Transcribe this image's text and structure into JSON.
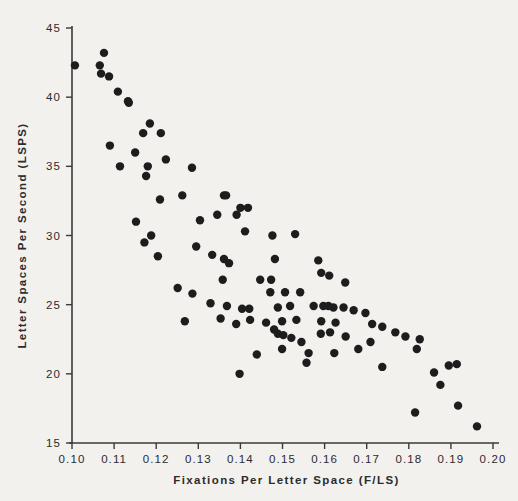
{
  "figure": {
    "background_color": "#f2f1ee",
    "point_color": "#1d1d1d",
    "axis_color": "#3a3a3a"
  },
  "chart_data": {
    "type": "scatter",
    "title": "",
    "xlabel": "Fixations  Per  Letter  Space  (F/LS)",
    "ylabel": "Letter  Spaces  Per  Second  (LSPS)",
    "xlim": [
      0.1,
      0.2
    ],
    "ylim": [
      15,
      45
    ],
    "xticks": [
      0.1,
      0.11,
      0.12,
      0.13,
      0.14,
      0.15,
      0.16,
      0.17,
      0.18,
      0.19,
      0.2
    ],
    "xticklabels": [
      "0.10",
      "0.11",
      "0.12",
      "0.13",
      "0.14",
      "0.15",
      "0.16",
      "0.17",
      "0.18",
      "0.19",
      "0.20"
    ],
    "yticks": [
      15,
      20,
      25,
      30,
      35,
      40,
      45
    ],
    "yticklabels": [
      "15",
      "20",
      "25",
      "30",
      "35",
      "40",
      "45"
    ],
    "grid": false,
    "legend": null,
    "marker": "filled-circle",
    "marker_size": 4.2,
    "points": [
      [
        0.1007,
        42.3
      ],
      [
        0.1076,
        43.2
      ],
      [
        0.1066,
        42.3
      ],
      [
        0.1069,
        41.7
      ],
      [
        0.1088,
        41.5
      ],
      [
        0.1109,
        40.4
      ],
      [
        0.1133,
        39.7
      ],
      [
        0.1135,
        39.6
      ],
      [
        0.1185,
        38.1
      ],
      [
        0.1169,
        37.4
      ],
      [
        0.1211,
        37.4
      ],
      [
        0.109,
        36.5
      ],
      [
        0.115,
        36.0
      ],
      [
        0.1114,
        35.0
      ],
      [
        0.1223,
        35.5
      ],
      [
        0.118,
        35.0
      ],
      [
        0.1176,
        34.3
      ],
      [
        0.1285,
        34.9
      ],
      [
        0.1209,
        32.6
      ],
      [
        0.1361,
        32.9
      ],
      [
        0.1366,
        32.9
      ],
      [
        0.1262,
        32.9
      ],
      [
        0.14,
        32.0
      ],
      [
        0.1418,
        32.0
      ],
      [
        0.1152,
        31.0
      ],
      [
        0.1304,
        31.1
      ],
      [
        0.1345,
        31.5
      ],
      [
        0.1391,
        31.5
      ],
      [
        0.1188,
        30.0
      ],
      [
        0.1172,
        29.5
      ],
      [
        0.1295,
        29.2
      ],
      [
        0.1204,
        28.5
      ],
      [
        0.1333,
        28.6
      ],
      [
        0.1361,
        28.3
      ],
      [
        0.1373,
        28.0
      ],
      [
        0.1411,
        30.3
      ],
      [
        0.1476,
        30.0
      ],
      [
        0.153,
        30.1
      ],
      [
        0.1482,
        28.3
      ],
      [
        0.1585,
        28.2
      ],
      [
        0.1592,
        27.3
      ],
      [
        0.1358,
        26.8
      ],
      [
        0.1447,
        26.8
      ],
      [
        0.1473,
        26.8
      ],
      [
        0.1611,
        27.1
      ],
      [
        0.1649,
        26.6
      ],
      [
        0.1471,
        25.9
      ],
      [
        0.1506,
        25.9
      ],
      [
        0.1542,
        25.9
      ],
      [
        0.1368,
        24.9
      ],
      [
        0.1404,
        24.7
      ],
      [
        0.1421,
        24.7
      ],
      [
        0.1489,
        24.8
      ],
      [
        0.1518,
        24.9
      ],
      [
        0.1574,
        24.9
      ],
      [
        0.1597,
        24.9
      ],
      [
        0.1609,
        24.9
      ],
      [
        0.1621,
        24.8
      ],
      [
        0.1645,
        24.8
      ],
      [
        0.1669,
        24.6
      ],
      [
        0.1697,
        24.4
      ],
      [
        0.1423,
        23.9
      ],
      [
        0.1461,
        23.7
      ],
      [
        0.1499,
        23.8
      ],
      [
        0.1533,
        23.9
      ],
      [
        0.1592,
        23.8
      ],
      [
        0.1626,
        23.7
      ],
      [
        0.1713,
        23.6
      ],
      [
        0.1737,
        23.4
      ],
      [
        0.148,
        23.2
      ],
      [
        0.1489,
        22.9
      ],
      [
        0.1502,
        22.8
      ],
      [
        0.1521,
        22.6
      ],
      [
        0.1545,
        22.3
      ],
      [
        0.1768,
        23.0
      ],
      [
        0.1792,
        22.7
      ],
      [
        0.1499,
        21.8
      ],
      [
        0.1591,
        22.9
      ],
      [
        0.1613,
        23.0
      ],
      [
        0.165,
        22.7
      ],
      [
        0.1709,
        22.3
      ],
      [
        0.1826,
        22.5
      ],
      [
        0.1819,
        21.8
      ],
      [
        0.1398,
        20.0
      ],
      [
        0.1557,
        20.8
      ],
      [
        0.1737,
        20.5
      ],
      [
        0.186,
        20.1
      ],
      [
        0.1895,
        20.6
      ],
      [
        0.1914,
        20.7
      ],
      [
        0.1875,
        19.2
      ],
      [
        0.1815,
        17.2
      ],
      [
        0.1917,
        17.7
      ],
      [
        0.1962,
        16.2
      ],
      [
        0.1439,
        21.4
      ],
      [
        0.1286,
        25.8
      ],
      [
        0.1251,
        26.2
      ],
      [
        0.1329,
        25.1
      ],
      [
        0.1268,
        23.8
      ],
      [
        0.1353,
        24.0
      ],
      [
        0.139,
        23.6
      ],
      [
        0.1562,
        21.5
      ],
      [
        0.1623,
        21.5
      ],
      [
        0.168,
        21.8
      ]
    ]
  }
}
